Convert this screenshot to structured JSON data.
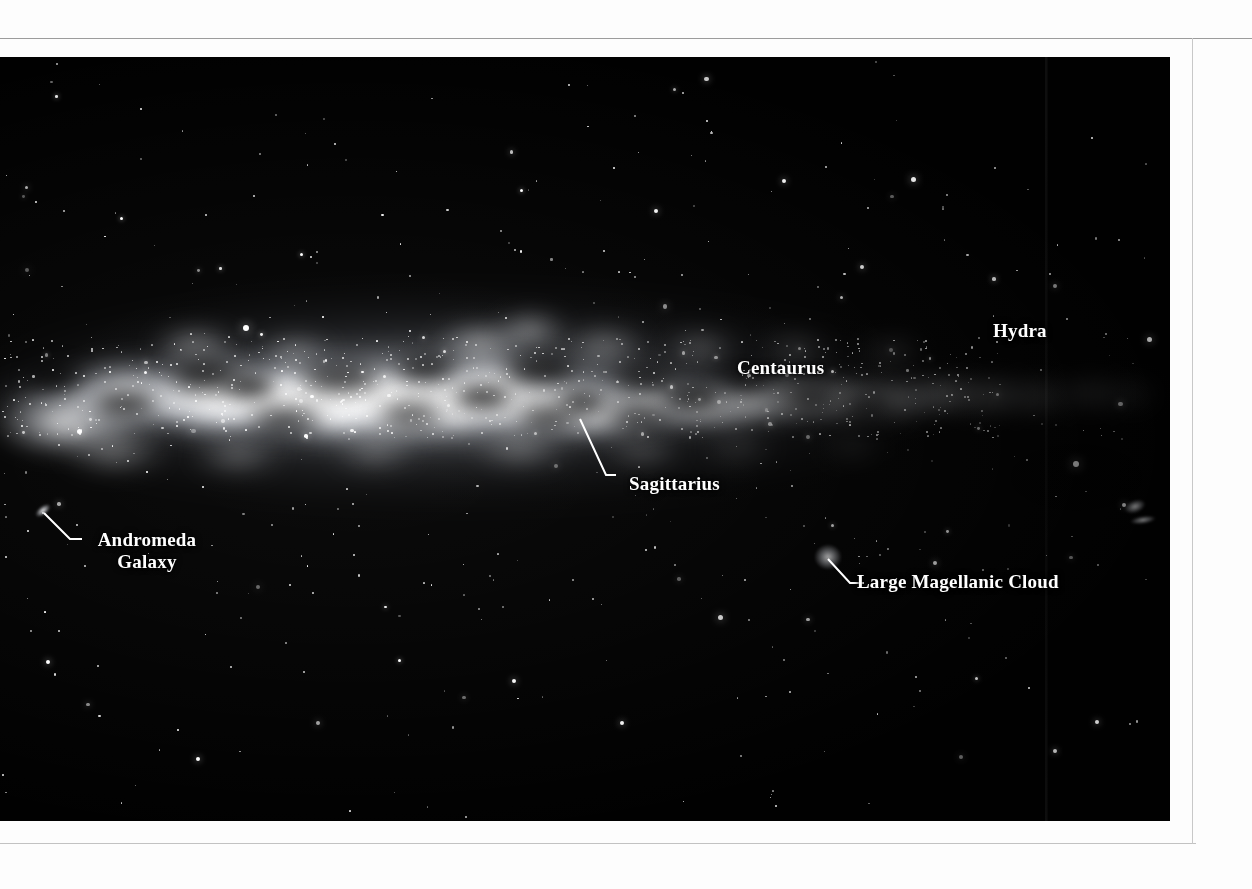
{
  "page": {
    "background_color": "#fdfdfd",
    "photo_background_color": "#010101",
    "label_color": "#ffffff"
  },
  "photo": {
    "subject": "panoramic-milky-way-photograph",
    "left": 0,
    "top": 57,
    "width": 1170,
    "height": 764
  },
  "labels": [
    {
      "id": "hydra",
      "text": "Hydra",
      "x": 993,
      "y": 320,
      "has_leader": false
    },
    {
      "id": "centaurus",
      "text": "Centaurus",
      "x": 737,
      "y": 357,
      "has_leader": false
    },
    {
      "id": "sagittarius",
      "text": "Sagittarius",
      "x": 629,
      "y": 473,
      "has_leader": true
    },
    {
      "id": "andromeda-galaxy",
      "line1": "Andromeda",
      "line2": "Galaxy",
      "text": "Andromeda Galaxy",
      "x": 82,
      "y": 529,
      "has_leader": true
    },
    {
      "id": "large-magellanic-cloud",
      "text": "Large Magellanic Cloud",
      "x": 857,
      "y": 571,
      "has_leader": true
    }
  ],
  "objects": [
    {
      "id": "andromeda-galaxy-smudge",
      "x": 42,
      "y": 512
    },
    {
      "id": "large-magellanic-cloud-smudge",
      "x": 828,
      "y": 558
    },
    {
      "id": "small-magellanic-cloud-smudge",
      "x": 1136,
      "y": 508
    }
  ]
}
